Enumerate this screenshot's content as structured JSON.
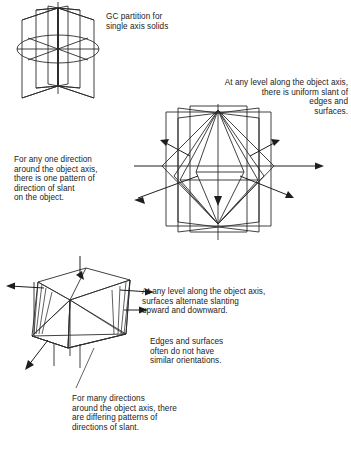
{
  "page": {
    "width": 351,
    "height": 452,
    "background_color": "#ffffff",
    "ink_color": "#2b2b2b"
  },
  "annotations": {
    "gc_partition": "GC partition for\nsingle axis solids",
    "uniform_slant": "At any level along the object axis,\nthere is uniform slant of\nedges and\nsurfaces.",
    "one_direction": "For any one direction\naround the object axis,\nthere is one pattern of\ndirection of slant\non the object.",
    "alternating": "At any level along the object axis,\nsurfaces alternate slanting\nupward and downward.",
    "edges_surfaces": "Edges and surfaces\noften do not have\nsimilar orientations.",
    "many_directions": "For many directions\naround the object axis, there\nare differing patterns of\ndirections of slant."
  },
  "figures": [
    {
      "name": "gc-partition-diagram",
      "caption_ref": "gc_partition",
      "description": "Radially intersecting rectangular planes about a vertical axis with a horizontal cross-section ellipse",
      "plane_count": 4,
      "has_axis": true,
      "has_cross_section_ellipse": true,
      "arrow_count": 0
    },
    {
      "name": "uniform-slant-diagram",
      "caption_ref": "uniform_slant",
      "description": "Bipyramid (diamond) solid inside radial rectangular planes with outward slant-direction arrows at one level",
      "plane_count": 4,
      "has_axis": true,
      "has_cross_section_ellipse": false,
      "arrow_count": 5
    },
    {
      "name": "alternating-slant-diagram",
      "caption_ref": "many_directions",
      "description": "Irregular multi-facet polyhedron with arrows pointing in differing slant directions",
      "plane_count": 0,
      "has_axis": false,
      "has_cross_section_ellipse": false,
      "arrow_count": 5
    }
  ]
}
